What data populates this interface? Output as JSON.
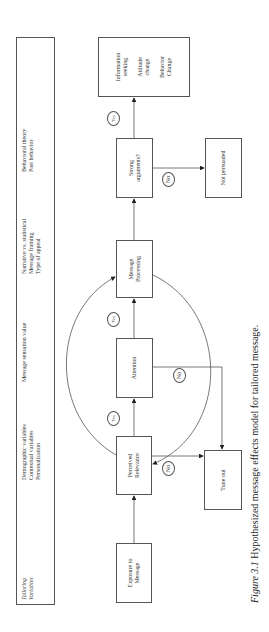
{
  "variables_panel": {
    "heading": [
      "Tailoring",
      "Variables"
    ],
    "groups": [
      [
        "Demographic variables",
        "Contextual variables",
        "Personalization"
      ],
      [
        "Message sensation value"
      ],
      [
        "Narrative vs. statistical",
        "Message framing",
        "Type of appeal"
      ],
      [
        "Behavioral theory",
        "Past behavior"
      ]
    ]
  },
  "nodes": {
    "exposure": [
      "Exposure to",
      "Message"
    ],
    "perceived_relevance": [
      "Perceived",
      "Relevance"
    ],
    "attention": [
      "Attention"
    ],
    "message_processing": [
      "Message",
      "Processing"
    ],
    "strong_arguments": [
      "Strong",
      "arguments?"
    ],
    "outcomes": [
      [
        "Information",
        "seeking"
      ],
      [
        "Attitude",
        "change"
      ],
      [
        "Behavior",
        "Change"
      ]
    ],
    "not_persuaded": [
      "Not persuaded"
    ],
    "tune_out": [
      "Tune out"
    ]
  },
  "edge_labels": {
    "yes": "Yes",
    "no": "No"
  },
  "caption": {
    "figure_number": "Figure 3.1",
    "text": "Hypothesized message effects model for tailored message."
  }
}
